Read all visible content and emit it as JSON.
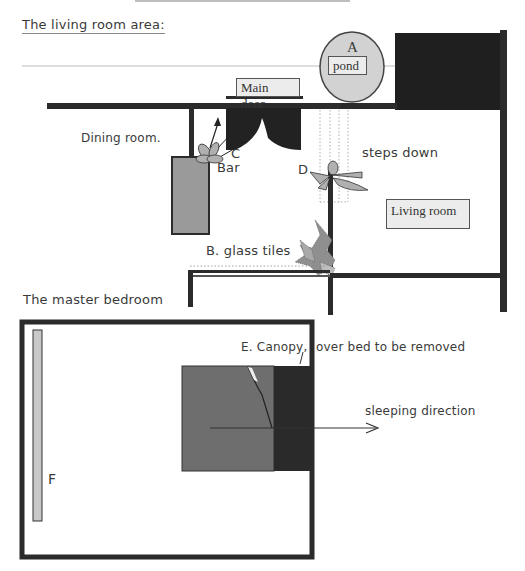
{
  "living_room_section": {
    "title": "The  living room area:",
    "labels": {
      "pond_marker": "A",
      "pond": "pond",
      "main_door": "Main door",
      "dining_room": "Dining room.",
      "plant_c": "C",
      "bar": "Bar",
      "plant_d": "D",
      "steps_down": "steps down",
      "living_room": "Living room",
      "glass_tiles": "B. glass tiles"
    }
  },
  "bedroom_section": {
    "title": "The master bedroom",
    "labels": {
      "canopy_prefix": "E. Canopy,",
      "canopy_suffix": "over bed to be removed",
      "sleeping_direction": "sleeping direction",
      "marker_f": "F"
    }
  },
  "colors": {
    "wall": "#2b2b2b",
    "pond_fill": "#d2d2d2",
    "bar_fill": "#9a9a9a",
    "bed_fill": "#6e6e6e",
    "headboard_fill": "#2a2a2a",
    "plant_fill": "#a8a8a8"
  }
}
